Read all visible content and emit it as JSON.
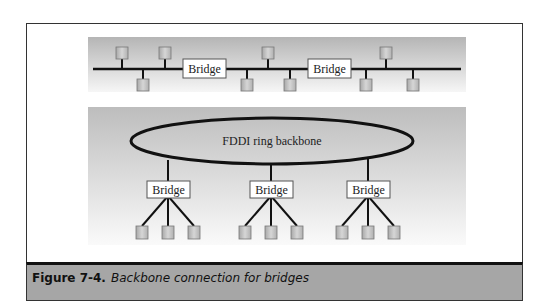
{
  "figure": {
    "label": "Figure 7-4.",
    "title": "Backbone connection for bridges"
  },
  "colors": {
    "band_top": "#b8b8b8",
    "band_bottom": "#f4f4f4",
    "node_fill": "#c4c4c4",
    "line": "#111111",
    "caption_bg": "#a6a6a6"
  },
  "top_segment": {
    "bridges": [
      {
        "label": "Bridge"
      },
      {
        "label": "Bridge"
      }
    ],
    "nodes_above_count": 4,
    "nodes_below_count": 5
  },
  "backbone": {
    "ring_label": "FDDI ring backbone",
    "bridges": [
      {
        "label": "Bridge",
        "leaf_nodes": 3
      },
      {
        "label": "Bridge",
        "leaf_nodes": 3
      },
      {
        "label": "Bridge",
        "leaf_nodes": 3
      }
    ]
  }
}
